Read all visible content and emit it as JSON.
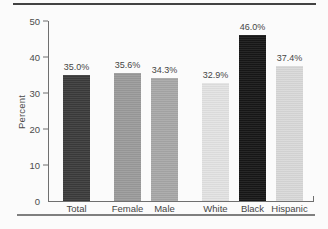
{
  "figure": {
    "background": "#fbfbfb",
    "top_rule_color": "#424242",
    "bottom_rule_color": "#7f7f7f",
    "axis_color": "#6f6f6f",
    "text_color": "#4a4a4a"
  },
  "chart_data": {
    "type": "bar",
    "title": "",
    "xlabel": "",
    "ylabel": "Percent",
    "ylim": [
      0,
      50
    ],
    "yticks": [
      0,
      10,
      20,
      30,
      40,
      50
    ],
    "grid": false,
    "legend": false,
    "categories": [
      "Total",
      "Female",
      "Male",
      "White",
      "Black",
      "Hispanic"
    ],
    "values": [
      35.0,
      35.6,
      34.3,
      32.9,
      46.0,
      37.4
    ],
    "value_labels": [
      "35.0%",
      "35.6%",
      "34.3%",
      "32.9%",
      "46.0%",
      "37.4%"
    ],
    "bar_colors": [
      "#3b3b3b",
      "#9b9b9b",
      "#a8a8a8",
      "#e3e3e3",
      "#171717",
      "#d9d9d9"
    ],
    "groups": [
      [
        0
      ],
      [
        1,
        2
      ],
      [
        3,
        4,
        5
      ]
    ]
  }
}
